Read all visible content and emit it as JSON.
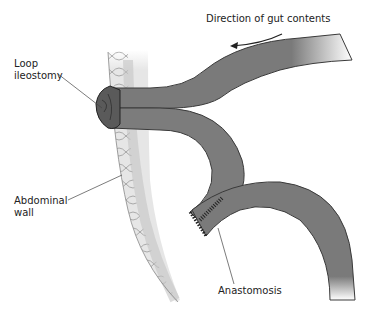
{
  "diagram": {
    "labels": {
      "direction": "Direction of gut contents",
      "loop_ileostomy_1": "Loop",
      "loop_ileostomy_2": "ileostomy",
      "abdominal_wall_1": "Abdominal",
      "abdominal_wall_2": "wall",
      "anastomosis": "Anastomosis"
    },
    "colors": {
      "bowel": "#7a7a7a",
      "bowel_dark": "#4a4a4a",
      "wall": "#e4e4e4",
      "wall_shadow": "#c8c8c8",
      "stoma": "#555555",
      "text": "#222222"
    }
  }
}
